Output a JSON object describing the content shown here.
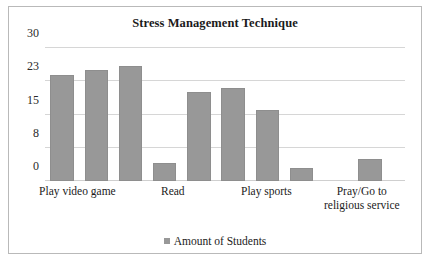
{
  "chart_data": {
    "type": "bar",
    "title": "Stress Management Technique",
    "xlabel": "",
    "ylabel": "",
    "ylim": [
      0,
      30
    ],
    "yticks": [
      0,
      8,
      15,
      23,
      30
    ],
    "ytick_labels": [
      "0",
      "8",
      "15",
      "23",
      "30"
    ],
    "grid": true,
    "legend_position": "bottom",
    "series": [
      {
        "name": "Amount of Students",
        "color": "#989898",
        "values": [
          24,
          25,
          26,
          4,
          20,
          21,
          16,
          3,
          0,
          5
        ]
      }
    ],
    "categories": [
      "Play video game",
      "",
      "Read",
      "",
      "Play sports",
      "",
      "Pray/Go to religious service",
      "",
      "",
      ""
    ],
    "visible_category_labels": [
      {
        "text_lines": [
          "Play video game"
        ],
        "center_pct": 9.0
      },
      {
        "text_lines": [
          "Read"
        ],
        "center_pct": 35.5
      },
      {
        "text_lines": [
          "Play sports"
        ],
        "center_pct": 61.5
      },
      {
        "text_lines": [
          "Pray/Go to",
          "religious service"
        ],
        "center_pct": 88.0
      }
    ],
    "bars": [
      {
        "value": 24,
        "left_pct": 1.5,
        "width_pct": 6.5
      },
      {
        "value": 25,
        "left_pct": 11.0,
        "width_pct": 6.5
      },
      {
        "value": 26,
        "left_pct": 20.5,
        "width_pct": 6.5
      },
      {
        "value": 4,
        "left_pct": 30.0,
        "width_pct": 6.5
      },
      {
        "value": 20,
        "left_pct": 39.5,
        "width_pct": 6.5
      },
      {
        "value": 21,
        "left_pct": 49.0,
        "width_pct": 6.5
      },
      {
        "value": 16,
        "left_pct": 58.5,
        "width_pct": 6.5
      },
      {
        "value": 3,
        "left_pct": 68.0,
        "width_pct": 6.5
      },
      {
        "value": 5,
        "left_pct": 87.0,
        "width_pct": 6.5
      }
    ]
  },
  "legend": {
    "label": "Amount of Students",
    "swatch_color": "#989898"
  }
}
